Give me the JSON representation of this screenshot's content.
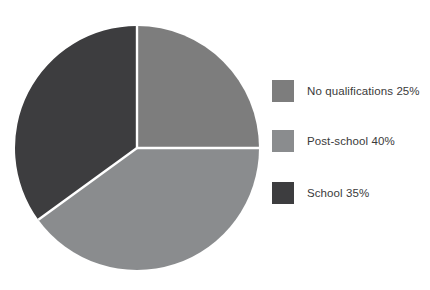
{
  "chart_data": {
    "type": "pie",
    "title": "",
    "categories": [
      "No qualifications",
      "Post-school",
      "School"
    ],
    "values": [
      25,
      40,
      35
    ],
    "units": "%",
    "labels": [
      "No qualifications 25%",
      "Post-school 40%",
      "School 35%"
    ],
    "colors": [
      "#7d7d7d",
      "#8a8c8e",
      "#3d3d3f"
    ],
    "start_angle_deg": 0,
    "direction": "clockwise",
    "slice_separator_color": "#ffffff",
    "legend_position": "right",
    "grid": false,
    "background": "#ffffff"
  },
  "legend": {
    "entries": [
      {
        "label": "No qualifications 25%",
        "color": "#7d7d7d",
        "swatch_name": "legend-swatch-no-qualifications"
      },
      {
        "label": "Post-school 40%",
        "color": "#8a8c8e",
        "swatch_name": "legend-swatch-post-school"
      },
      {
        "label": "School 35%",
        "color": "#3d3d3f",
        "swatch_name": "legend-swatch-school"
      }
    ]
  },
  "pie_geometry": {
    "center_x": 137,
    "center_y": 148,
    "radius": 122
  }
}
